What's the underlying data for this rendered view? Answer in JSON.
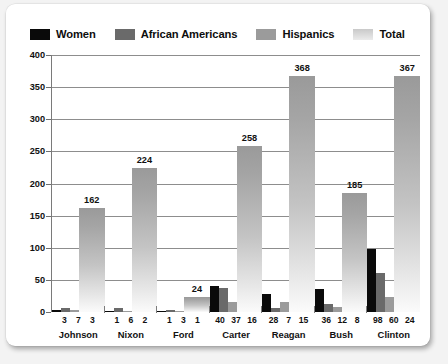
{
  "legend": {
    "items": [
      {
        "label": "Women",
        "color": "#0a0a0a",
        "key": "women"
      },
      {
        "label": "African Americans",
        "color": "#6a6a6a",
        "key": "africans"
      },
      {
        "label": "Hispanics",
        "color": "#9b9b9b",
        "key": "hispanics"
      },
      {
        "label": "Total",
        "color": "#d9d9d9",
        "key": "total"
      }
    ]
  },
  "yaxis": {
    "ticks": [
      "400",
      "350",
      "300",
      "250",
      "200",
      "150",
      "100",
      "50",
      "0"
    ]
  },
  "chart_data": {
    "type": "bar",
    "title": "",
    "subtitle": "",
    "xlabel": "",
    "ylabel": "",
    "ylim": [
      0,
      400
    ],
    "ytick_values": [
      0,
      50,
      100,
      150,
      200,
      250,
      300,
      350,
      400
    ],
    "grid": true,
    "legend_position": "top-left",
    "categories": [
      "Johnson",
      "Nixon",
      "Ford",
      "Carter",
      "Reagan",
      "Bush",
      "Clinton"
    ],
    "series": [
      {
        "name": "Women",
        "values": [
          3,
          1,
          1,
          40,
          28,
          36,
          98
        ]
      },
      {
        "name": "African Americans",
        "values": [
          7,
          6,
          3,
          37,
          7,
          12,
          60
        ]
      },
      {
        "name": "Hispanics",
        "values": [
          3,
          2,
          1,
          16,
          15,
          8,
          24
        ]
      },
      {
        "name": "Total",
        "values": [
          162,
          224,
          24,
          258,
          368,
          185,
          367
        ]
      }
    ],
    "total_labels": [
      "162",
      "224",
      "24",
      "258",
      "368",
      "185",
      "367"
    ],
    "value_labels": [
      [
        "3",
        "7",
        "3"
      ],
      [
        "1",
        "6",
        "2"
      ],
      [
        "1",
        "3",
        "1"
      ],
      [
        "40",
        "37",
        "16"
      ],
      [
        "28",
        "7",
        "15"
      ],
      [
        "36",
        "12",
        "8"
      ],
      [
        "98",
        "60",
        "24"
      ]
    ]
  }
}
